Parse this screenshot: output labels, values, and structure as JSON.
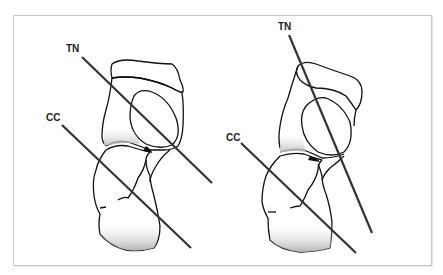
{
  "figure": {
    "panels": [
      {
        "id": "left",
        "labels": {
          "tn": "TN",
          "cc": "CC"
        }
      },
      {
        "id": "right",
        "labels": {
          "tn": "TN",
          "cc": "CC"
        }
      }
    ]
  },
  "colors": {
    "line": "#333333",
    "outline": "#111111",
    "shade": "#bdbdbd",
    "frame": "#c8c8c8"
  }
}
